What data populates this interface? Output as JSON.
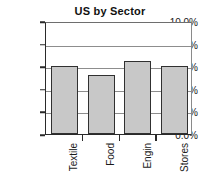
{
  "chart_data": {
    "type": "bar",
    "title": "US by Sector",
    "xlabel": "",
    "ylabel": "",
    "categories": [
      "Textile",
      "Food",
      "Engin",
      "Stores"
    ],
    "values": [
      6.0,
      5.2,
      6.5,
      6.0
    ],
    "value_labels": [
      "6.0%",
      "5.2%",
      "6.5%",
      "6.0%"
    ],
    "ylim": [
      0.0,
      10.0
    ],
    "ytick_values": [
      0.0,
      2.0,
      4.0,
      6.0,
      8.0,
      10.0
    ],
    "ytick_labels": [
      "0.0%",
      "2.0%",
      "4.0%",
      "6.0%",
      "8.0%",
      "10.0%"
    ],
    "grid": true,
    "grid_axis": "y",
    "legend": false,
    "legend_position": "none",
    "bar_fill_color": "#c8c8c8",
    "bar_border_color": "#303030",
    "axis_color": "#2a2a2a",
    "grid_color": "#8d8d8d",
    "background_color": "#ffffff",
    "text_color": "#1a1a1a",
    "xlabel_rotation": 90
  }
}
